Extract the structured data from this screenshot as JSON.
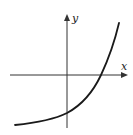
{
  "figure": {
    "axes": {
      "x_label": "x",
      "y_label": "y"
    },
    "colors": {
      "background": "#ffffff",
      "axis": "#333333",
      "curve": "#1a1a1a"
    },
    "curve": {
      "shape": "exponential-growth",
      "y_intercept_sign": "negative",
      "x_intercept_sign": "positive",
      "left_asymptote": "horizontal, below x-axis",
      "points_px": [
        [
          15,
          125
        ],
        [
          40,
          121
        ],
        [
          67,
          113
        ],
        [
          88,
          96
        ],
        [
          101,
          75
        ],
        [
          112,
          50
        ],
        [
          119,
          23
        ]
      ]
    }
  }
}
